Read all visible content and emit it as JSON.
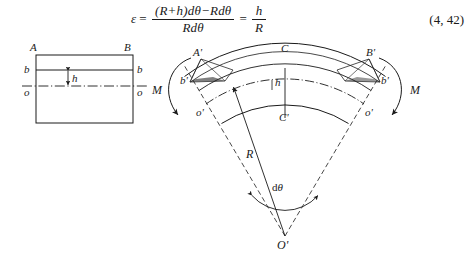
{
  "equation": {
    "lhs": "ε",
    "equals": "=",
    "numerator": "(R+h)dθ−Rdθ",
    "denominator": "Rdθ",
    "equals2": "=",
    "result_numerator": "h",
    "result_denominator": "R",
    "number": "(4, 42)"
  },
  "left_figure": {
    "name": "straight-beam-cross-section",
    "labels": {
      "corner_top_left": "A",
      "corner_top_right": "B",
      "fiber_left": "b",
      "fiber_right": "b",
      "height_dim": "h",
      "axis_left": "o",
      "axis_right": "o"
    }
  },
  "right_figure": {
    "name": "curved-beam-bending-element",
    "labels": {
      "top_left": "A'",
      "top_center": "C",
      "top_right": "B'",
      "fiber_left": "b'",
      "fiber_right": "b'",
      "height_dim": "h",
      "moment_left": "M",
      "moment_right": "M",
      "axis_left": "o'",
      "axis_right": "o'",
      "neutral_center": "C'",
      "radius": "R",
      "angle": "dθ",
      "center": "O'"
    }
  },
  "caption": {
    "text": ""
  },
  "colors": {
    "ink": "#1a1a1a",
    "paper": "#ffffff",
    "faint": "#8a8a8a"
  }
}
